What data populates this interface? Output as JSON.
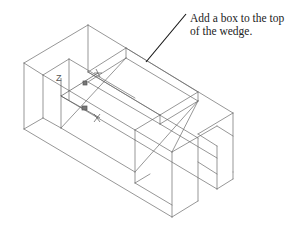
{
  "figure": {
    "type": "isometric-wireframe",
    "stroke_color": "#6a6a6a",
    "leader_color": "#111111",
    "background": "#ffffff"
  },
  "callout": {
    "line1": "Add a box to the top",
    "line2": "of the wedge."
  },
  "ucs_icon": {
    "z_label": "Z",
    "y_label": "Y",
    "x_label": "X"
  }
}
